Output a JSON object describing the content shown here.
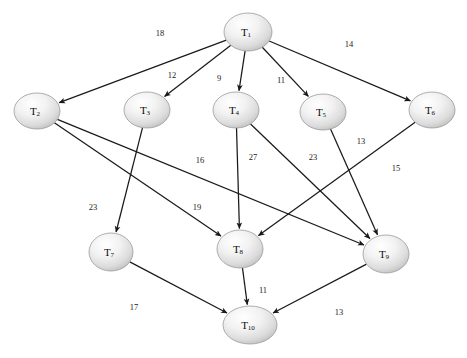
{
  "diagram": {
    "type": "directed-weighted-graph",
    "background_color": "#ffffff",
    "edge_color": "#1a1a1a",
    "node_fill_light": "#fdfdfd",
    "node_fill_dark": "#bdbdbd",
    "node_stroke": "#9a9a9a",
    "label_color": "#0d0d0d"
  },
  "nodes": [
    {
      "id": "T1",
      "base": "T",
      "sub": "1",
      "cx": 248,
      "cy": 32,
      "rx": 24,
      "ry": 19
    },
    {
      "id": "T2",
      "base": "T",
      "sub": "2",
      "cx": 37,
      "cy": 111,
      "rx": 23,
      "ry": 18
    },
    {
      "id": "T3",
      "base": "T",
      "sub": "3",
      "cx": 147,
      "cy": 110,
      "rx": 23,
      "ry": 18
    },
    {
      "id": "T4",
      "base": "T",
      "sub": "4",
      "cx": 236,
      "cy": 110,
      "rx": 23,
      "ry": 18
    },
    {
      "id": "T5",
      "base": "T",
      "sub": "5",
      "cx": 323,
      "cy": 112,
      "rx": 23,
      "ry": 18
    },
    {
      "id": "T6",
      "base": "T",
      "sub": "6",
      "cx": 432,
      "cy": 110,
      "rx": 23,
      "ry": 18
    },
    {
      "id": "T7",
      "base": "T",
      "sub": "7",
      "cx": 111,
      "cy": 252,
      "rx": 22,
      "ry": 19
    },
    {
      "id": "T8",
      "base": "T",
      "sub": "8",
      "cx": 240,
      "cy": 249,
      "rx": 23,
      "ry": 19
    },
    {
      "id": "T9",
      "base": "T",
      "sub": "9",
      "cx": 386,
      "cy": 254,
      "rx": 23,
      "ry": 19
    },
    {
      "id": "T10",
      "base": "T",
      "sub": "10",
      "cx": 250,
      "cy": 325,
      "rx": 27,
      "ry": 19
    }
  ],
  "edges": [
    {
      "from": "T1",
      "to": "T2",
      "weight": "18",
      "label_x": 160,
      "label_y": 33
    },
    {
      "from": "T1",
      "to": "T3",
      "weight": "12",
      "label_x": 172,
      "label_y": 75
    },
    {
      "from": "T1",
      "to": "T4",
      "weight": "9",
      "label_x": 219,
      "label_y": 78
    },
    {
      "from": "T1",
      "to": "T5",
      "weight": "11",
      "label_x": 281,
      "label_y": 80
    },
    {
      "from": "T1",
      "to": "T6",
      "weight": "14",
      "label_x": 349,
      "label_y": 44
    },
    {
      "from": "T2",
      "to": "T9",
      "weight": "16",
      "label_x": 200,
      "label_y": 160
    },
    {
      "from": "T2",
      "to": "T8",
      "weight": "19",
      "label_x": 197,
      "label_y": 207
    },
    {
      "from": "T3",
      "to": "T7",
      "weight": "23",
      "label_x": 93,
      "label_y": 207
    },
    {
      "from": "T4",
      "to": "T8",
      "weight": "27",
      "label_x": 253,
      "label_y": 157
    },
    {
      "from": "T4",
      "to": "T9",
      "weight": "23",
      "label_x": 313,
      "label_y": 157
    },
    {
      "from": "T5",
      "to": "T9",
      "weight": "13",
      "label_x": 361,
      "label_y": 141
    },
    {
      "from": "T6",
      "to": "T8",
      "weight": "15",
      "label_x": 396,
      "label_y": 168
    },
    {
      "from": "T7",
      "to": "T10",
      "weight": "17",
      "label_x": 134,
      "label_y": 307
    },
    {
      "from": "T8",
      "to": "T10",
      "weight": "11",
      "label_x": 263,
      "label_y": 290
    },
    {
      "from": "T9",
      "to": "T10",
      "weight": "13",
      "label_x": 339,
      "label_y": 312
    }
  ]
}
